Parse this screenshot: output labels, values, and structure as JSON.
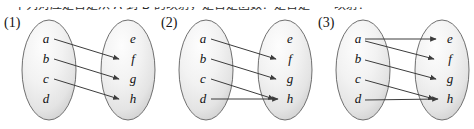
{
  "top_text_strip": "下列对应是否是从 A 到 B 的映射，是否是函数？是否是一一映射？",
  "figure": {
    "panels": [
      {
        "label": "(1)",
        "domain_label": "A",
        "codomain_label": "B",
        "left_nodes": [
          "a",
          "b",
          "c",
          "d"
        ],
        "right_nodes": [
          "e",
          "f",
          "g",
          "h"
        ],
        "arrows": [
          {
            "from": "a",
            "to": "f",
            "double_head": false
          },
          {
            "from": "b",
            "to": "g",
            "double_head": false
          },
          {
            "from": "c",
            "to": "h",
            "double_head": false
          }
        ],
        "unmapped_left_nodes": [
          "d"
        ],
        "unreached_right_nodes": [
          "e"
        ]
      },
      {
        "label": "(2)",
        "domain_label": "A",
        "codomain_label": "B",
        "left_nodes": [
          "a",
          "b",
          "c",
          "d"
        ],
        "right_nodes": [
          "e",
          "f",
          "g",
          "h"
        ],
        "arrows": [
          {
            "from": "a",
            "to": "f",
            "double_head": false
          },
          {
            "from": "b",
            "to": "g",
            "double_head": false
          },
          {
            "from": "c",
            "to": "h",
            "double_head": true
          },
          {
            "from": "d",
            "to": "h",
            "double_head": true
          }
        ],
        "unmapped_left_nodes": [],
        "unreached_right_nodes": [
          "e"
        ]
      },
      {
        "label": "(3)",
        "domain_label": "A",
        "codomain_label": "B",
        "left_nodes": [
          "a",
          "b",
          "c",
          "d"
        ],
        "right_nodes": [
          "e",
          "f",
          "g",
          "h"
        ],
        "arrows": [
          {
            "from": "a",
            "to": "e",
            "double_head": false
          },
          {
            "from": "a",
            "to": "f",
            "double_head": false
          },
          {
            "from": "b",
            "to": "g",
            "double_head": false
          },
          {
            "from": "c",
            "to": "h",
            "double_head": true
          },
          {
            "from": "d",
            "to": "h",
            "double_head": true
          }
        ],
        "unmapped_left_nodes": [],
        "unreached_right_nodes": []
      }
    ]
  },
  "colors": {
    "page_background": "#ffffff",
    "ellipse_fill_light": "#fdfdfd",
    "ellipse_fill_mid": "#ededed",
    "ellipse_fill_edge": "#d2d2d2",
    "ellipse_stroke": "#6f6f6f",
    "arrow_stroke": "#3c3c3c",
    "label_text": "#101010"
  }
}
